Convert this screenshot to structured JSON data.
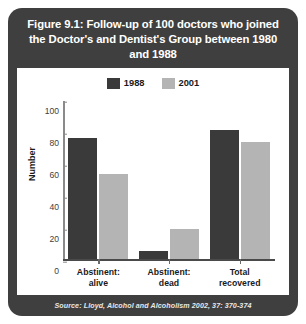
{
  "figure": {
    "title": "Figure 9.1: Follow-up of 100 doctors who joined the Doctor's and Dentist's Group between 1980 and 1988",
    "source": "Source: Lloyd, Alcohol and Alcoholism 2002, 37: 370-374"
  },
  "colors": {
    "panel_background": "#3f3f3f",
    "plot_background": "#ffffff",
    "series_1988": "#3a3a3a",
    "series_2001": "#b4b4b4",
    "axis": "#8a8a8a",
    "text": "#1a1a1a"
  },
  "chart_data": {
    "type": "bar",
    "title": "Figure 9.1: Follow-up of 100 doctors who joined the Doctor's and Dentist's Group between 1980 and 1988",
    "categories": [
      "Abstinent: alive",
      "Abstinent: dead",
      "Total recovered"
    ],
    "category_lines": [
      [
        "Abstinent:",
        "alive"
      ],
      [
        "Abstinent:",
        "dead"
      ],
      [
        "Total",
        "recovered"
      ]
    ],
    "series": [
      {
        "name": "1988",
        "color": "#3a3a3a",
        "values": [
          76,
          5,
          81
        ]
      },
      {
        "name": "2001",
        "color": "#b4b4b4",
        "values": [
          53,
          19,
          73
        ]
      }
    ],
    "xlabel": "",
    "ylabel": "Number",
    "ylim": [
      0,
      100
    ],
    "yticks": [
      0,
      20,
      40,
      60,
      80,
      100
    ],
    "grid": false,
    "legend_position": "top-center"
  }
}
